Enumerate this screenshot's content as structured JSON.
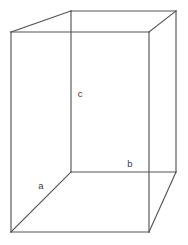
{
  "figure": {
    "kind": "rectangular-prism-diagram",
    "background_color": "#ffffff",
    "stroke_color": "#555555",
    "label_color": "#3a3a3a",
    "canvas": {
      "width": 188,
      "height": 245
    },
    "labels": {
      "depth": "a",
      "width": "b",
      "height": "c"
    },
    "label_positions": {
      "depth": {
        "x": 41,
        "y": 186
      },
      "width": {
        "x": 130,
        "y": 164
      },
      "height": {
        "x": 80,
        "y": 94
      }
    },
    "vertices": {
      "front_top_left": {
        "x": 11,
        "y": 32
      },
      "front_top_right": {
        "x": 149,
        "y": 32
      },
      "front_bottom_left": {
        "x": 11,
        "y": 232
      },
      "front_bottom_right": {
        "x": 149,
        "y": 232
      },
      "back_top_left": {
        "x": 71,
        "y": 11
      },
      "back_top_right": {
        "x": 176,
        "y": 11
      },
      "back_bottom_left": {
        "x": 71,
        "y": 172
      },
      "back_bottom_right": {
        "x": 176,
        "y": 172
      }
    },
    "edges": {
      "front_top": "M11,32 L149,32",
      "front_left": "M11,32 L11,232",
      "front_bottom": "M11,232 L149,232",
      "front_right": "M149,32 L149,232",
      "back_top": "M71,11 L176,11",
      "back_right": "M176,11 L176,172",
      "back_bottom": "M71,172 L176,172",
      "back_left_vertical": "M71,11 L71,172",
      "connector_top_left": "M11,32 L71,11",
      "connector_top_right": "M149,32 L176,11",
      "connector_bottom_left": "M11,232 L71,172",
      "connector_bottom_right": "M149,232 L176,172"
    }
  }
}
